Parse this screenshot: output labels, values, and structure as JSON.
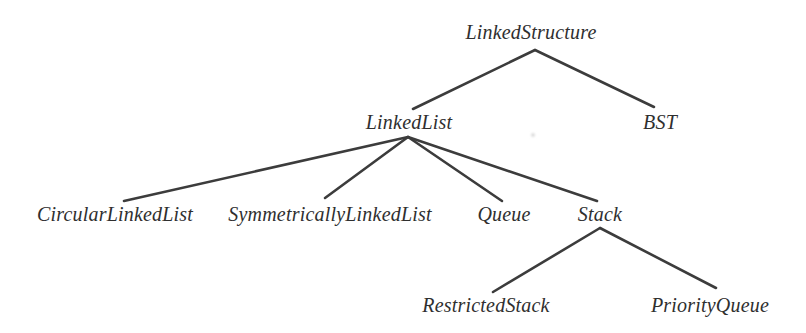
{
  "diagram": {
    "type": "tree",
    "background": "#ffffff",
    "line_color": "#3c3c3c",
    "line_width": 2.6,
    "text_color": "#2f2f2f",
    "nodes": [
      {
        "id": "linkedstructure",
        "label": "LinkedStructure",
        "x": 531,
        "y": 32
      },
      {
        "id": "linkedlist",
        "label": "LinkedList",
        "x": 409,
        "y": 122
      },
      {
        "id": "bst",
        "label": "BST",
        "x": 660,
        "y": 122
      },
      {
        "id": "circularlinkedlist",
        "label": "CircularLinkedList",
        "x": 115,
        "y": 214
      },
      {
        "id": "symmetricallylinkedlist",
        "label": "SymmetricallyLinkedList",
        "x": 330,
        "y": 214
      },
      {
        "id": "queue",
        "label": "Queue",
        "x": 504,
        "y": 214
      },
      {
        "id": "stack",
        "label": "Stack",
        "x": 600,
        "y": 214
      },
      {
        "id": "restrictedstack",
        "label": "RestrictedStack",
        "x": 486,
        "y": 305
      },
      {
        "id": "priorityqueue",
        "label": "PriorityQueue",
        "x": 710,
        "y": 305
      }
    ],
    "edges": [
      {
        "from": "linkedstructure",
        "to": "linkedlist",
        "x1": 535,
        "y1": 50,
        "x2": 413,
        "y2": 109
      },
      {
        "from": "linkedstructure",
        "to": "bst",
        "x1": 535,
        "y1": 50,
        "x2": 654,
        "y2": 107
      },
      {
        "from": "linkedlist",
        "to": "circularlinkedlist",
        "x1": 408,
        "y1": 137,
        "x2": 124,
        "y2": 201
      },
      {
        "from": "linkedlist",
        "to": "symmetricallylinkedlist",
        "x1": 408,
        "y1": 137,
        "x2": 325,
        "y2": 198
      },
      {
        "from": "linkedlist",
        "to": "queue",
        "x1": 408,
        "y1": 137,
        "x2": 502,
        "y2": 201
      },
      {
        "from": "linkedlist",
        "to": "stack",
        "x1": 408,
        "y1": 137,
        "x2": 597,
        "y2": 201
      },
      {
        "from": "stack",
        "to": "restrictedstack",
        "x1": 600,
        "y1": 228,
        "x2": 493,
        "y2": 292
      },
      {
        "from": "stack",
        "to": "priorityqueue",
        "x1": 600,
        "y1": 228,
        "x2": 716,
        "y2": 288
      }
    ],
    "artifact_speck": {
      "x": 533,
      "y": 135
    },
    "hierarchy": {
      "label": "LinkedStructure",
      "children": [
        {
          "label": "LinkedList",
          "children": [
            {
              "label": "CircularLinkedList"
            },
            {
              "label": "SymmetricallyLinkedList"
            },
            {
              "label": "Queue"
            },
            {
              "label": "Stack",
              "children": [
                {
                  "label": "RestrictedStack"
                },
                {
                  "label": "PriorityQueue"
                }
              ]
            }
          ]
        },
        {
          "label": "BST"
        }
      ]
    }
  }
}
